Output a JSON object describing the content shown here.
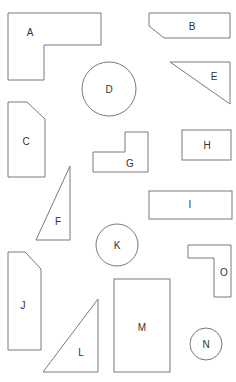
{
  "diagram": {
    "title": "",
    "stroke_color": "#7a7a7a",
    "label_color": "#333333",
    "background": "#ffffff",
    "shapes": [
      {
        "id": "A",
        "label": "A",
        "type": "l-shape"
      },
      {
        "id": "B",
        "label": "B",
        "type": "chamfered-rectangle"
      },
      {
        "id": "C",
        "label": "C",
        "type": "chamfered-rectangle"
      },
      {
        "id": "D",
        "label": "D",
        "type": "circle"
      },
      {
        "id": "E",
        "label": "E",
        "type": "right-triangle"
      },
      {
        "id": "F",
        "label": "F",
        "type": "right-triangle"
      },
      {
        "id": "G",
        "label": "G",
        "type": "l-shape"
      },
      {
        "id": "H",
        "label": "H",
        "type": "rectangle"
      },
      {
        "id": "I",
        "label": "I",
        "type": "rectangle"
      },
      {
        "id": "J",
        "label": "J",
        "type": "chamfered-rectangle"
      },
      {
        "id": "K",
        "label": "K",
        "type": "circle"
      },
      {
        "id": "L",
        "label": "L",
        "type": "right-triangle"
      },
      {
        "id": "M",
        "label": "M",
        "type": "rectangle"
      },
      {
        "id": "N",
        "label": "N",
        "type": "circle"
      },
      {
        "id": "O",
        "label": "O",
        "type": "l-shape"
      }
    ]
  }
}
